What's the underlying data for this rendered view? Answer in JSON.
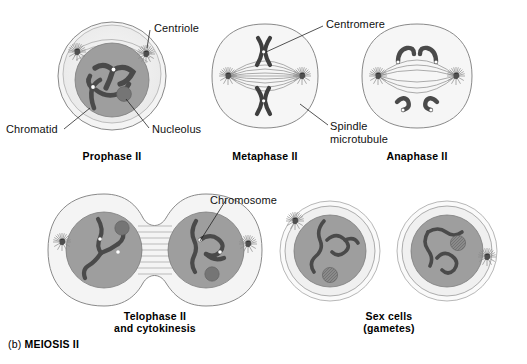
{
  "figure": {
    "caption_prefix": "(b) ",
    "caption_title": "MEIOSIS II",
    "background_color": "#ffffff",
    "ink_color": "#1a1a1a"
  },
  "palette": {
    "membrane_outer": "#f2f2f2",
    "cytoplasm": "#ededed",
    "nucleus": "#9e9e9e",
    "nucleus_dark": "#8f8f8f",
    "chromosome": "#4a4a4a",
    "chromosome_dark": "#3a3a3a",
    "nucleolus": "#757575",
    "centriole": "#5a5a5a",
    "outline": "#6e6e6e",
    "spindle": "#7a7a7a",
    "label_text": "#111111"
  },
  "panels": [
    {
      "id": "prophase-2",
      "caption": "Prophase II",
      "caption_lines": [
        "Prophase II"
      ],
      "description": "Round cell with large gray nucleus, condensed chromosomes, nucleolus and two centrioles with asters"
    },
    {
      "id": "metaphase-2",
      "caption": "Metaphase II",
      "caption_lines": [
        "Metaphase II"
      ],
      "description": "Oval cell, nuclear envelope gone, two X-shaped chromosomes aligned at the equator on spindle"
    },
    {
      "id": "anaphase-2",
      "caption": "Anaphase II",
      "caption_lines": [
        "Anaphase II"
      ],
      "description": "Oval cell with sister chromatids separated and pulled toward opposite poles"
    },
    {
      "id": "telophase-2",
      "caption": "Telophase II and cytokinesis",
      "caption_lines": [
        "Telophase II",
        "and cytokinesis"
      ],
      "description": "Dumbbell shaped dividing cell with two reforming nuclei and midbody fibers"
    },
    {
      "id": "sex-cells",
      "caption": "Sex cells (gametes)",
      "caption_lines": [
        "Sex cells",
        "(gametes)"
      ],
      "description": "Two separate round haploid gamete cells with decondensed chromosomes"
    }
  ],
  "labels": [
    {
      "id": "centriole",
      "text": "Centriole",
      "lines": [
        "Centriole"
      ]
    },
    {
      "id": "centromere",
      "text": "Centromere",
      "lines": [
        "Centromere"
      ]
    },
    {
      "id": "chromatid",
      "text": "Chromatid",
      "lines": [
        "Chromatid"
      ]
    },
    {
      "id": "nucleolus",
      "text": "Nucleolus",
      "lines": [
        "Nucleolus"
      ]
    },
    {
      "id": "spindle-microtubule",
      "text": "Spindle microtubule",
      "lines": [
        "Spindle",
        "microtubule"
      ]
    },
    {
      "id": "chromosome",
      "text": "Chromosome",
      "lines": [
        "Chromosome"
      ]
    }
  ]
}
